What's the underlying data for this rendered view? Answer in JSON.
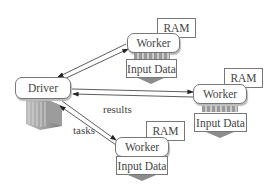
{
  "diagram": {
    "driver": {
      "label": "Driver"
    },
    "workers": [
      {
        "label": "Worker",
        "ram": "RAM",
        "data": "Input Data"
      },
      {
        "label": "Worker",
        "ram": "RAM",
        "data": "Input Data"
      },
      {
        "label": "Worker",
        "ram": "RAM",
        "data": "Input Data"
      }
    ],
    "edge_labels": {
      "results": "results",
      "tasks": "tasks"
    },
    "colors": {
      "stroke": "#333333",
      "box_border": "#777777",
      "server": "#8a8a8a"
    }
  }
}
